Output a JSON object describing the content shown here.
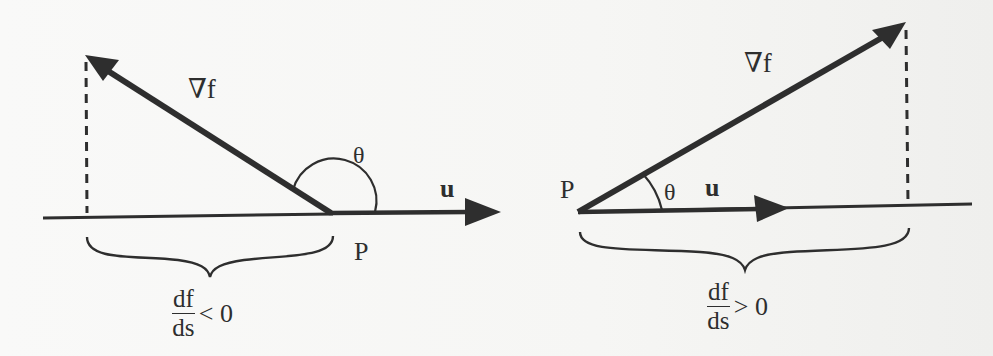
{
  "diagram": {
    "type": "directional-derivative-illustration",
    "colors": {
      "ink": "#2e2e2e",
      "background": "#f7f7f5"
    },
    "panels": [
      {
        "id": "left",
        "case": "obtuse angle",
        "labels": {
          "gradient": "∇f",
          "angle": "θ",
          "direction": "u",
          "point": "P"
        },
        "result": {
          "numerator": "df",
          "denominator": "ds",
          "relation": "< 0"
        }
      },
      {
        "id": "right",
        "case": "acute angle",
        "labels": {
          "gradient": "∇f",
          "angle": "θ",
          "direction": "u",
          "point": "P"
        },
        "result": {
          "numerator": "df",
          "denominator": "ds",
          "relation": "> 0"
        }
      }
    ]
  }
}
